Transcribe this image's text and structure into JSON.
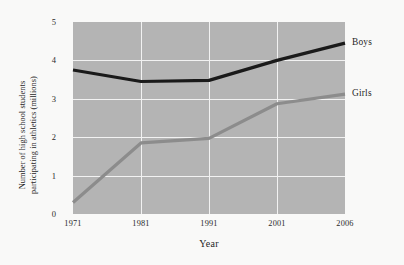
{
  "chart_data": {
    "type": "line",
    "title": "",
    "xlabel": "Year",
    "ylabel_line1": "Number of high school students",
    "ylabel_line2": "participating in athletics (millions)",
    "categories": [
      "1971",
      "1981",
      "1991",
      "2001",
      "2006"
    ],
    "xticklabels": [
      "1971",
      "1981",
      "1991",
      "2001",
      "2006"
    ],
    "yticklabels": [
      "0",
      "1",
      "2",
      "3",
      "4",
      "5"
    ],
    "ylim": [
      0,
      5
    ],
    "yticks": [
      0,
      1,
      2,
      3,
      4,
      5
    ],
    "grid": true,
    "grid_color": "#f2f2f2",
    "plot_background": "#b4b4b4",
    "figure_background": "#f9f9f8",
    "legend_position": "right-of-line-ends",
    "series": [
      {
        "name": "Boys",
        "color": "#1a1a1a",
        "values": [
          3.75,
          3.45,
          3.48,
          4.0,
          4.45
        ]
      },
      {
        "name": "Girls",
        "color": "#8c8c8c",
        "values": [
          0.3,
          1.85,
          1.97,
          2.87,
          3.12
        ]
      }
    ]
  }
}
